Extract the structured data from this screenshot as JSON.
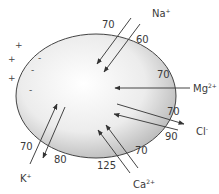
{
  "diagram": {
    "type": "ion-flux-across-cell-membrane",
    "cell": {
      "shape": "ellipse",
      "fill_center": "#ffffff",
      "fill_edge": "#b8b8b8",
      "stroke": "#444444"
    },
    "outside_charges": [
      "+",
      "+",
      "+"
    ],
    "inside_charges": [
      "-",
      "-",
      "-"
    ],
    "ions": [
      {
        "name": "Na",
        "charge": "+",
        "flows": [
          {
            "value": "70",
            "direction": "in"
          },
          {
            "value": "60",
            "direction": "in"
          }
        ]
      },
      {
        "name": "Mg",
        "charge": "2+",
        "flows": [
          {
            "value": "70",
            "direction": "in"
          }
        ]
      },
      {
        "name": "Cl",
        "charge": "-",
        "flows": [
          {
            "value": "70",
            "direction": "out"
          },
          {
            "value": "90",
            "direction": "in"
          }
        ]
      },
      {
        "name": "Ca",
        "charge": "2+",
        "flows": [
          {
            "value": "125",
            "direction": "in"
          },
          {
            "value": "70",
            "direction": "in"
          }
        ]
      },
      {
        "name": "K",
        "charge": "+",
        "flows": [
          {
            "value": "70",
            "direction": "in"
          },
          {
            "value": "80",
            "direction": "out"
          }
        ]
      }
    ]
  }
}
